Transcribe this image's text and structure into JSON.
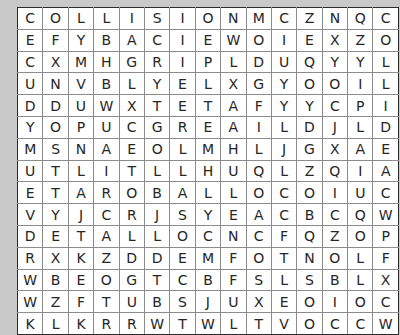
{
  "puzzle": {
    "type": "word-search",
    "rows": 15,
    "columns": 15,
    "grid": [
      [
        "C",
        "O",
        "L",
        "L",
        "I",
        "S",
        "I",
        "O",
        "N",
        "M",
        "C",
        "Z",
        "N",
        "Q",
        "C"
      ],
      [
        "E",
        "F",
        "Y",
        "B",
        "A",
        "C",
        "I",
        "E",
        "W",
        "O",
        "I",
        "E",
        "X",
        "Z",
        "O"
      ],
      [
        "C",
        "X",
        "M",
        "H",
        "G",
        "R",
        "I",
        "P",
        "L",
        "D",
        "U",
        "Q",
        "Y",
        "Y",
        "L"
      ],
      [
        "U",
        "N",
        "V",
        "B",
        "L",
        "Y",
        "E",
        "L",
        "X",
        "G",
        "Y",
        "O",
        "O",
        "I",
        "L"
      ],
      [
        "D",
        "D",
        "U",
        "W",
        "X",
        "T",
        "E",
        "T",
        "A",
        "F",
        "Y",
        "Y",
        "C",
        "P",
        "I"
      ],
      [
        "Y",
        "O",
        "P",
        "U",
        "C",
        "G",
        "R",
        "E",
        "A",
        "I",
        "L",
        "D",
        "J",
        "L",
        "D"
      ],
      [
        "M",
        "S",
        "N",
        "A",
        "E",
        "O",
        "L",
        "M",
        "H",
        "L",
        "J",
        "G",
        "X",
        "A",
        "E"
      ],
      [
        "U",
        "T",
        "L",
        "I",
        "T",
        "L",
        "L",
        "H",
        "U",
        "Q",
        "L",
        "Z",
        "Q",
        "I",
        "A"
      ],
      [
        "E",
        "T",
        "A",
        "R",
        "O",
        "B",
        "A",
        "L",
        "L",
        "O",
        "C",
        "O",
        "I",
        "U",
        "C"
      ],
      [
        "V",
        "Y",
        "J",
        "C",
        "R",
        "J",
        "S",
        "Y",
        "E",
        "A",
        "C",
        "B",
        "C",
        "Q",
        "W"
      ],
      [
        "D",
        "E",
        "T",
        "A",
        "L",
        "L",
        "O",
        "C",
        "N",
        "C",
        "F",
        "Q",
        "Z",
        "O",
        "P"
      ],
      [
        "R",
        "X",
        "K",
        "Z",
        "D",
        "D",
        "E",
        "M",
        "F",
        "O",
        "T",
        "N",
        "O",
        "L",
        "F"
      ],
      [
        "W",
        "B",
        "E",
        "O",
        "G",
        "T",
        "C",
        "B",
        "F",
        "S",
        "L",
        "S",
        "B",
        "L",
        "X"
      ],
      [
        "W",
        "Z",
        "F",
        "T",
        "U",
        "B",
        "S",
        "J",
        "U",
        "X",
        "E",
        "O",
        "I",
        "O",
        "C"
      ],
      [
        "K",
        "L",
        "K",
        "R",
        "R",
        "W",
        "T",
        "W",
        "L",
        "T",
        "V",
        "O",
        "C",
        "C",
        "W"
      ]
    ],
    "colors": {
      "page_background": "#c9c9c9",
      "cell_background": "#ffffff",
      "cell_border": "#8c8c8c",
      "outer_border": "#2b2b2b",
      "letter_color": "#262626"
    }
  }
}
